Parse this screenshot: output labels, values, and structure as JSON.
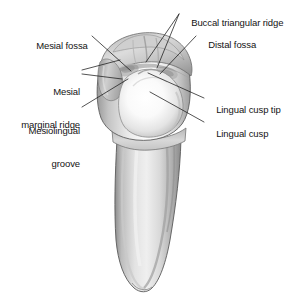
{
  "figure": {
    "view": "lingual view of crown and root",
    "background_color": "#ffffff",
    "line_color": "#1a1a1a",
    "text_color": "#131313",
    "enamel_light": "#fdfdfd",
    "enamel_mid": "#d8d8d8",
    "enamel_shadow": "#9a9a9a",
    "root_light": "#ededed",
    "root_mid": "#c9c9c9",
    "root_shadow": "#8f8f8f",
    "outline_color": "#4d4d4d"
  },
  "labels": [
    {
      "id": "buccal-triangular-ridge",
      "text": "Buccal triangular ridge",
      "lines": [
        "Buccal triangular ridge"
      ],
      "align": "left",
      "x": 181,
      "y": 6
    },
    {
      "id": "distal-fossa",
      "text": "Distal fossa",
      "lines": [
        "Distal fossa"
      ],
      "align": "left",
      "x": 198,
      "y": 28
    },
    {
      "id": "mesial-fossa",
      "text": "Mesial fossa",
      "lines": [
        "Mesial fossa"
      ],
      "align": "left",
      "x": 26,
      "y": 29
    },
    {
      "id": "mesial-marginal-ridge",
      "text": "Mesial marginal ridge",
      "lines": [
        "Mesial",
        "marginal ridge"
      ],
      "align": "right",
      "x": 6,
      "y": 64
    },
    {
      "id": "mesiolingual-groove",
      "text": "Mesiolingual groove",
      "lines": [
        "Mesiolingual",
        "groove"
      ],
      "align": "right",
      "x": 6,
      "y": 103
    },
    {
      "id": "lingual-cusp-tip",
      "text": "Lingual cusp tip",
      "lines": [
        "Lingual cusp tip"
      ],
      "align": "left",
      "x": 206,
      "y": 93
    },
    {
      "id": "lingual-cusp",
      "text": "Lingual cusp",
      "lines": [
        "Lingual cusp"
      ],
      "align": "left",
      "x": 206,
      "y": 117
    }
  ],
  "leader_lines": [
    {
      "id": "leader-buccal-1",
      "from": [
        179,
        14
      ],
      "to": [
        146,
        62
      ]
    },
    {
      "id": "leader-buccal-2",
      "from": [
        179,
        14
      ],
      "to": [
        157,
        68
      ]
    },
    {
      "id": "leader-distal-fossa",
      "from": [
        196,
        36
      ],
      "to": [
        160,
        74
      ]
    },
    {
      "id": "leader-mesial-fossa",
      "from": [
        92,
        36
      ],
      "to": [
        131,
        71
      ]
    },
    {
      "id": "leader-mesial-marginal-1",
      "from": [
        82,
        70
      ],
      "to": [
        120,
        60
      ]
    },
    {
      "id": "leader-mesial-marginal-2",
      "from": [
        82,
        74
      ],
      "to": [
        122,
        79
      ]
    },
    {
      "id": "leader-mesiolingual-groove",
      "from": [
        82,
        107
      ],
      "to": [
        128,
        79
      ]
    },
    {
      "id": "leader-lingual-cusp-tip",
      "from": [
        204,
        98
      ],
      "to": [
        148,
        73
      ]
    },
    {
      "id": "leader-lingual-cusp",
      "from": [
        204,
        122
      ],
      "to": [
        150,
        92
      ]
    }
  ]
}
